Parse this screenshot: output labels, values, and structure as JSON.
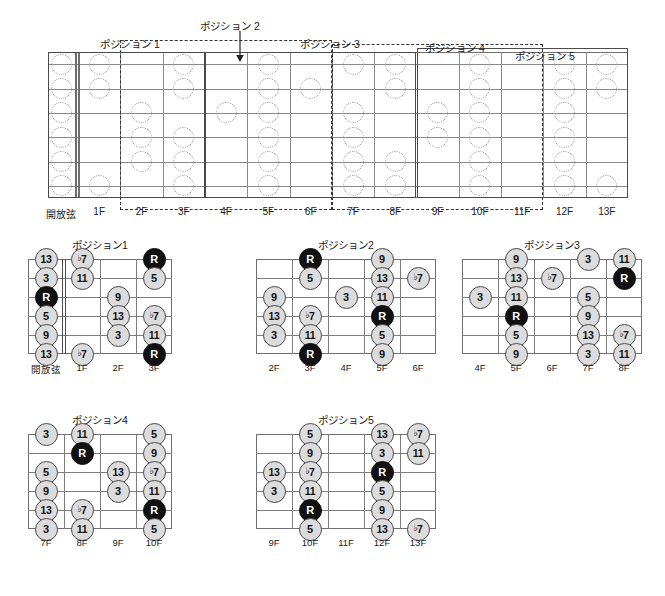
{
  "document": {
    "kind": "guitar-fretboard-position-chart",
    "language": "ja"
  },
  "colors": {
    "root_fill": "#111111",
    "root_text": "#ffffff",
    "note_fill": "#dcdcdc",
    "note_text": "#111111",
    "board_line": "#6e6e6e",
    "string_line": "#8a8a8a",
    "ghost_note_outline": "#9a9a9a",
    "box_solid": "#4a4a4a",
    "box_dashed": "#333333"
  },
  "master": {
    "name": "full-fretboard",
    "string_count": 6,
    "open_label": "開放弦",
    "fret_labels": [
      "開放弦",
      "1F",
      "2F",
      "3F",
      "4F",
      "5F",
      "6F",
      "7F",
      "8F",
      "9F",
      "10F",
      "11F",
      "12F",
      "13F"
    ],
    "position_boxes": [
      {
        "label": "ポジション 1",
        "style": "solid",
        "start_fret": 0,
        "end_fret": 3,
        "label_x": 100,
        "label_y": 36
      },
      {
        "label": "ポジション 2",
        "style": "dashed",
        "start_fret": 2,
        "end_fret": 6,
        "label_x": 200,
        "label_y": 18
      },
      {
        "label": "ポジション 3",
        "style": "solid",
        "start_fret": 4,
        "end_fret": 8,
        "label_x": 300,
        "label_y": 36
      },
      {
        "label": "ポジション 4",
        "style": "dashed",
        "start_fret": 7,
        "end_fret": 11,
        "label_x": 425,
        "label_y": 40
      },
      {
        "label": "ポジション 5",
        "style": "solid",
        "start_fret": 9,
        "end_fret": 13,
        "label_x": 515,
        "label_y": 48
      }
    ],
    "ghost_notes": [
      {
        "string": 1,
        "fret": 0
      },
      {
        "string": 2,
        "fret": 0
      },
      {
        "string": 3,
        "fret": 0
      },
      {
        "string": 4,
        "fret": 0
      },
      {
        "string": 5,
        "fret": 0
      },
      {
        "string": 6,
        "fret": 0
      },
      {
        "string": 1,
        "fret": 1
      },
      {
        "string": 2,
        "fret": 1
      },
      {
        "string": 6,
        "fret": 1
      },
      {
        "string": 3,
        "fret": 2
      },
      {
        "string": 4,
        "fret": 2
      },
      {
        "string": 5,
        "fret": 2
      },
      {
        "string": 1,
        "fret": 3
      },
      {
        "string": 2,
        "fret": 3
      },
      {
        "string": 4,
        "fret": 3
      },
      {
        "string": 5,
        "fret": 3
      },
      {
        "string": 6,
        "fret": 3
      },
      {
        "string": 3,
        "fret": 4
      },
      {
        "string": 1,
        "fret": 5
      },
      {
        "string": 2,
        "fret": 5
      },
      {
        "string": 3,
        "fret": 5
      },
      {
        "string": 4,
        "fret": 5
      },
      {
        "string": 5,
        "fret": 5
      },
      {
        "string": 6,
        "fret": 5
      },
      {
        "string": 2,
        "fret": 6
      },
      {
        "string": 1,
        "fret": 7
      },
      {
        "string": 3,
        "fret": 7
      },
      {
        "string": 4,
        "fret": 7
      },
      {
        "string": 5,
        "fret": 7
      },
      {
        "string": 6,
        "fret": 7
      },
      {
        "string": 1,
        "fret": 8
      },
      {
        "string": 2,
        "fret": 8
      },
      {
        "string": 5,
        "fret": 8
      },
      {
        "string": 6,
        "fret": 8
      },
      {
        "string": 3,
        "fret": 9
      },
      {
        "string": 4,
        "fret": 9
      },
      {
        "string": 1,
        "fret": 10
      },
      {
        "string": 2,
        "fret": 10
      },
      {
        "string": 3,
        "fret": 10
      },
      {
        "string": 4,
        "fret": 10
      },
      {
        "string": 5,
        "fret": 10
      },
      {
        "string": 6,
        "fret": 10
      },
      {
        "string": 1,
        "fret": 12
      },
      {
        "string": 2,
        "fret": 12
      },
      {
        "string": 3,
        "fret": 12
      },
      {
        "string": 4,
        "fret": 12
      },
      {
        "string": 5,
        "fret": 12
      },
      {
        "string": 6,
        "fret": 12
      },
      {
        "string": 1,
        "fret": 13
      },
      {
        "string": 2,
        "fret": 13
      },
      {
        "string": 6,
        "fret": 13
      }
    ]
  },
  "diagrams": [
    {
      "id": "position-1",
      "title": "ポジション1",
      "fret_labels": [
        "開放弦",
        "1F",
        "2F",
        "3F"
      ],
      "columns": 4,
      "has_nut": true,
      "nut_after_column": 1,
      "notes": [
        {
          "string": 1,
          "col": 0,
          "label": "13",
          "root": false
        },
        {
          "string": 2,
          "col": 0,
          "label": "3",
          "root": false
        },
        {
          "string": 3,
          "col": 0,
          "label": "R",
          "root": true
        },
        {
          "string": 4,
          "col": 0,
          "label": "5",
          "root": false
        },
        {
          "string": 5,
          "col": 0,
          "label": "9",
          "root": false
        },
        {
          "string": 6,
          "col": 0,
          "label": "13",
          "root": false
        },
        {
          "string": 1,
          "col": 1,
          "label": "♭7",
          "root": false
        },
        {
          "string": 2,
          "col": 1,
          "label": "11",
          "root": false
        },
        {
          "string": 6,
          "col": 1,
          "label": "♭7",
          "root": false
        },
        {
          "string": 3,
          "col": 2,
          "label": "9",
          "root": false
        },
        {
          "string": 4,
          "col": 2,
          "label": "13",
          "root": false
        },
        {
          "string": 5,
          "col": 2,
          "label": "3",
          "root": false
        },
        {
          "string": 1,
          "col": 3,
          "label": "R",
          "root": true
        },
        {
          "string": 2,
          "col": 3,
          "label": "5",
          "root": false
        },
        {
          "string": 4,
          "col": 3,
          "label": "♭7",
          "root": false
        },
        {
          "string": 5,
          "col": 3,
          "label": "11",
          "root": false
        },
        {
          "string": 6,
          "col": 3,
          "label": "R",
          "root": true
        }
      ]
    },
    {
      "id": "position-2",
      "title": "ポジション2",
      "fret_labels": [
        "2F",
        "3F",
        "4F",
        "5F",
        "6F"
      ],
      "columns": 5,
      "has_nut": false,
      "nut_after_column": -1,
      "notes": [
        {
          "string": 3,
          "col": 0,
          "label": "9",
          "root": false
        },
        {
          "string": 4,
          "col": 0,
          "label": "13",
          "root": false
        },
        {
          "string": 5,
          "col": 0,
          "label": "3",
          "root": false
        },
        {
          "string": 1,
          "col": 1,
          "label": "R",
          "root": true
        },
        {
          "string": 2,
          "col": 1,
          "label": "5",
          "root": false
        },
        {
          "string": 4,
          "col": 1,
          "label": "♭7",
          "root": false
        },
        {
          "string": 5,
          "col": 1,
          "label": "11",
          "root": false
        },
        {
          "string": 6,
          "col": 1,
          "label": "R",
          "root": true
        },
        {
          "string": 3,
          "col": 2,
          "label": "3",
          "root": false
        },
        {
          "string": 1,
          "col": 3,
          "label": "9",
          "root": false
        },
        {
          "string": 2,
          "col": 3,
          "label": "13",
          "root": false
        },
        {
          "string": 3,
          "col": 3,
          "label": "11",
          "root": false
        },
        {
          "string": 4,
          "col": 3,
          "label": "R",
          "root": true
        },
        {
          "string": 5,
          "col": 3,
          "label": "5",
          "root": false
        },
        {
          "string": 6,
          "col": 3,
          "label": "9",
          "root": false
        },
        {
          "string": 2,
          "col": 4,
          "label": "♭7",
          "root": false
        }
      ]
    },
    {
      "id": "position-3",
      "title": "ポジション3",
      "fret_labels": [
        "4F",
        "5F",
        "6F",
        "7F",
        "8F"
      ],
      "columns": 5,
      "has_nut": false,
      "nut_after_column": -1,
      "notes": [
        {
          "string": 3,
          "col": 0,
          "label": "3",
          "root": false
        },
        {
          "string": 1,
          "col": 1,
          "label": "9",
          "root": false
        },
        {
          "string": 2,
          "col": 1,
          "label": "13",
          "root": false
        },
        {
          "string": 3,
          "col": 1,
          "label": "11",
          "root": false
        },
        {
          "string": 4,
          "col": 1,
          "label": "R",
          "root": true
        },
        {
          "string": 5,
          "col": 1,
          "label": "5",
          "root": false
        },
        {
          "string": 6,
          "col": 1,
          "label": "9",
          "root": false
        },
        {
          "string": 2,
          "col": 2,
          "label": "♭7",
          "root": false
        },
        {
          "string": 1,
          "col": 3,
          "label": "3",
          "root": false
        },
        {
          "string": 3,
          "col": 3,
          "label": "5",
          "root": false
        },
        {
          "string": 4,
          "col": 3,
          "label": "9",
          "root": false
        },
        {
          "string": 5,
          "col": 3,
          "label": "13",
          "root": false
        },
        {
          "string": 6,
          "col": 3,
          "label": "3",
          "root": false
        },
        {
          "string": 1,
          "col": 4,
          "label": "11",
          "root": false
        },
        {
          "string": 2,
          "col": 4,
          "label": "R",
          "root": true
        },
        {
          "string": 5,
          "col": 4,
          "label": "♭7",
          "root": false
        },
        {
          "string": 6,
          "col": 4,
          "label": "11",
          "root": false
        }
      ]
    },
    {
      "id": "position-4",
      "title": "ポジション4",
      "fret_labels": [
        "7F",
        "8F",
        "9F",
        "10F"
      ],
      "columns": 4,
      "has_nut": false,
      "nut_after_column": -1,
      "notes": [
        {
          "string": 1,
          "col": 0,
          "label": "3",
          "root": false
        },
        {
          "string": 3,
          "col": 0,
          "label": "5",
          "root": false
        },
        {
          "string": 4,
          "col": 0,
          "label": "9",
          "root": false
        },
        {
          "string": 5,
          "col": 0,
          "label": "13",
          "root": false
        },
        {
          "string": 6,
          "col": 0,
          "label": "3",
          "root": false
        },
        {
          "string": 1,
          "col": 1,
          "label": "11",
          "root": false
        },
        {
          "string": 2,
          "col": 1,
          "label": "R",
          "root": true
        },
        {
          "string": 5,
          "col": 1,
          "label": "♭7",
          "root": false
        },
        {
          "string": 6,
          "col": 1,
          "label": "11",
          "root": false
        },
        {
          "string": 3,
          "col": 2,
          "label": "13",
          "root": false
        },
        {
          "string": 4,
          "col": 2,
          "label": "3",
          "root": false
        },
        {
          "string": 1,
          "col": 3,
          "label": "5",
          "root": false
        },
        {
          "string": 2,
          "col": 3,
          "label": "9",
          "root": false
        },
        {
          "string": 3,
          "col": 3,
          "label": "♭7",
          "root": false
        },
        {
          "string": 4,
          "col": 3,
          "label": "11",
          "root": false
        },
        {
          "string": 5,
          "col": 3,
          "label": "R",
          "root": true
        },
        {
          "string": 6,
          "col": 3,
          "label": "5",
          "root": false
        }
      ]
    },
    {
      "id": "position-5",
      "title": "ポジション5",
      "fret_labels": [
        "9F",
        "10F",
        "11F",
        "12F",
        "13F"
      ],
      "columns": 5,
      "has_nut": false,
      "nut_after_column": -1,
      "notes": [
        {
          "string": 3,
          "col": 0,
          "label": "13",
          "root": false
        },
        {
          "string": 4,
          "col": 0,
          "label": "3",
          "root": false
        },
        {
          "string": 1,
          "col": 1,
          "label": "5",
          "root": false
        },
        {
          "string": 2,
          "col": 1,
          "label": "9",
          "root": false
        },
        {
          "string": 3,
          "col": 1,
          "label": "♭7",
          "root": false
        },
        {
          "string": 4,
          "col": 1,
          "label": "11",
          "root": false
        },
        {
          "string": 5,
          "col": 1,
          "label": "R",
          "root": true
        },
        {
          "string": 6,
          "col": 1,
          "label": "5",
          "root": false
        },
        {
          "string": 1,
          "col": 3,
          "label": "13",
          "root": false
        },
        {
          "string": 2,
          "col": 3,
          "label": "3",
          "root": false
        },
        {
          "string": 3,
          "col": 3,
          "label": "R",
          "root": true
        },
        {
          "string": 4,
          "col": 3,
          "label": "5",
          "root": false
        },
        {
          "string": 5,
          "col": 3,
          "label": "9",
          "root": false
        },
        {
          "string": 6,
          "col": 3,
          "label": "13",
          "root": false
        },
        {
          "string": 1,
          "col": 4,
          "label": "♭7",
          "root": false
        },
        {
          "string": 2,
          "col": 4,
          "label": "11",
          "root": false
        },
        {
          "string": 6,
          "col": 4,
          "label": "♭7",
          "root": false
        }
      ]
    }
  ]
}
